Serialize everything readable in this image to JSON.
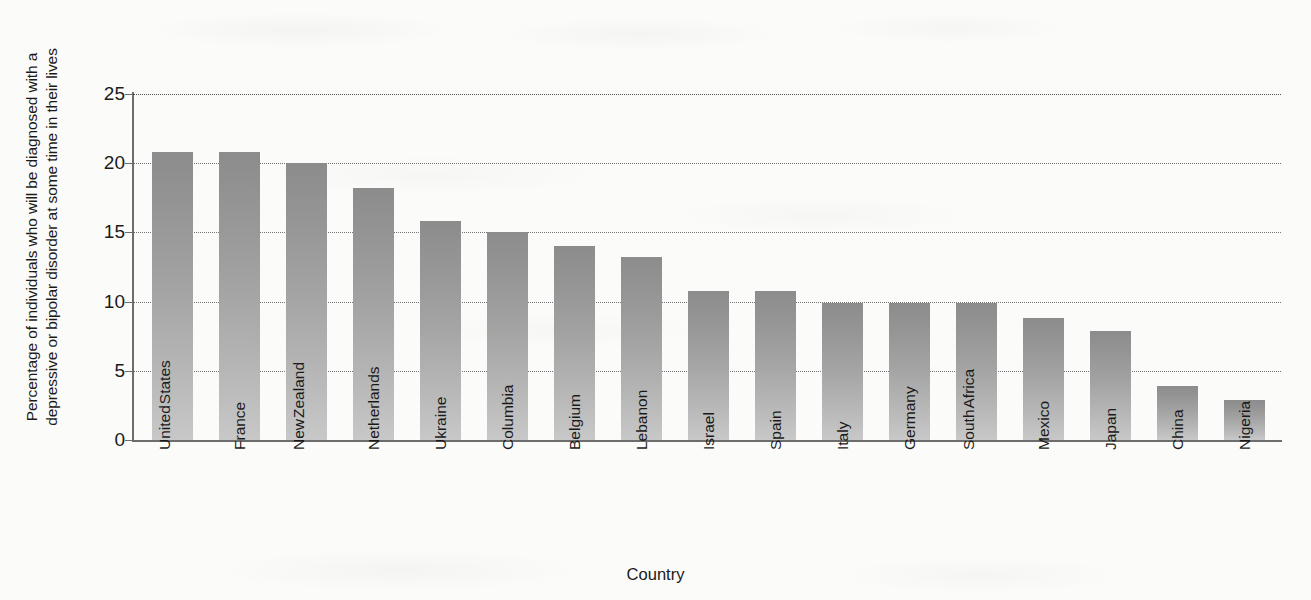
{
  "chart_data": {
    "type": "bar",
    "title": "",
    "subtitle": "",
    "xlabel": "Country",
    "ylabel": "Percentage of individuals who will be diagnosed with a depressive or bipolar disorder at some time in their lives",
    "ylabel_lines": [
      "Percentage of individuals who will be diagnosed with a",
      "depressive or bipolar disorder at some time in their lives"
    ],
    "categories": [
      "United States",
      "France",
      "New Zealand",
      "Netherlands",
      "Ukraine",
      "Columbia",
      "Belgium",
      "Lebanon",
      "Israel",
      "Spain",
      "Italy",
      "Germany",
      "South Africa",
      "Mexico",
      "Japan",
      "China",
      "Nigeria"
    ],
    "category_lines": [
      [
        "United",
        "States"
      ],
      [
        "France"
      ],
      [
        "New",
        "Zealand"
      ],
      [
        "Netherlands"
      ],
      [
        "Ukraine"
      ],
      [
        "Columbia"
      ],
      [
        "Belgium"
      ],
      [
        "Lebanon"
      ],
      [
        "Israel"
      ],
      [
        "Spain"
      ],
      [
        "Italy"
      ],
      [
        "Germany"
      ],
      [
        "South",
        "Africa"
      ],
      [
        "Mexico"
      ],
      [
        "Japan"
      ],
      [
        "China"
      ],
      [
        "Nigeria"
      ]
    ],
    "values": [
      20.8,
      20.8,
      20.0,
      18.2,
      15.8,
      15.0,
      14.0,
      13.2,
      10.8,
      10.8,
      9.9,
      9.9,
      9.9,
      8.8,
      7.9,
      3.9,
      2.9
    ],
    "ylim": [
      0,
      25
    ],
    "yticks": [
      0,
      5,
      10,
      15,
      20,
      25
    ],
    "ytick_labels": [
      "0",
      "5",
      "10",
      "15",
      "20",
      "25"
    ],
    "grid": "horizontal-dotted",
    "legend": "none",
    "bar_color_top": "#8c8c8c",
    "bar_color_bottom": "#c8c8c8",
    "axis_color": "#6d6d6d",
    "background": "#fbfbf9"
  }
}
